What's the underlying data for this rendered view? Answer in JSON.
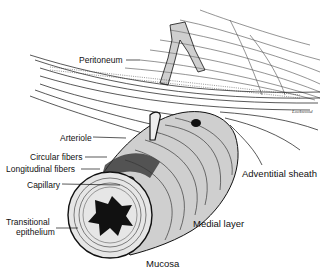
{
  "figure": {
    "labels": {
      "peritoneum": "Peritoneum",
      "arteriole": "Arteriole",
      "circular_fibers": "Circular fibers",
      "longitudinal_fibers": "Longitudinal fibers",
      "capillary": "Capillary",
      "transitional_epithelium_1": "Transitional",
      "transitional_epithelium_2": "epithelium",
      "adventitial_sheath": "Adventitial sheath",
      "medial_layer": "Medial layer",
      "mucosa": "Mucosa"
    },
    "signature": "Lockwood"
  }
}
